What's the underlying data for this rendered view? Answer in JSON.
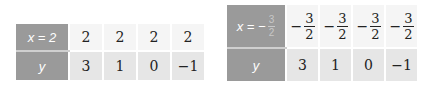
{
  "table_left": {
    "header_x": "x = 2",
    "header_y": "y",
    "x_values": [
      "2",
      "2",
      "2",
      "2"
    ],
    "y_values": [
      "3",
      "1",
      "0",
      "−1"
    ]
  },
  "table_right": {
    "header_x_prefix": "x = −",
    "header_x_num": "3",
    "header_x_den": "2",
    "header_y": "y",
    "x_values": [
      {
        "sign": "−",
        "num": "3",
        "den": "2"
      },
      {
        "sign": "−",
        "num": "3",
        "den": "2"
      },
      {
        "sign": "−",
        "num": "3",
        "den": "2"
      },
      {
        "sign": "−",
        "num": "3",
        "den": "2"
      }
    ],
    "y_values": [
      "3",
      "1",
      "0",
      "−1"
    ]
  },
  "colors": {
    "header_bg": "#9a9a9a",
    "row1_bg": "#f5f5f5",
    "row2_bg": "#e6e6e6"
  }
}
